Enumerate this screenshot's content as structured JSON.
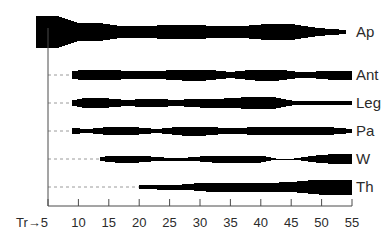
{
  "chart_data": {
    "type": "area",
    "title": "",
    "subtitle": "",
    "xlabel": "",
    "ylabel": "",
    "grid": false,
    "legend_position": "right",
    "axis": {
      "origin_label": "Tr",
      "origin_arrow": "→",
      "xlim": [
        5,
        55
      ],
      "tick_step": 5,
      "tick_labels": [
        "5",
        "10",
        "15",
        "20",
        "25",
        "30",
        "35",
        "40",
        "45",
        "50",
        "55"
      ],
      "tick_values": [
        5,
        10,
        15,
        20,
        25,
        30,
        35,
        40,
        45,
        50,
        55
      ]
    },
    "series": [
      {
        "name": "Ap",
        "label": "Ap",
        "start": 3.0,
        "x": [
          3.0,
          6.5,
          10.0,
          13.5,
          17.0,
          21.0,
          25.0,
          29.0,
          33.0,
          37.0,
          41.0,
          45.0,
          49.5,
          54.0
        ],
        "widths": [
          32,
          32,
          18,
          18,
          12,
          12,
          14,
          14,
          12,
          12,
          16,
          16,
          8,
          4
        ]
      },
      {
        "name": "Ant",
        "label": "Ant",
        "start": 9.0,
        "x": [
          9.0,
          11.0,
          15.0,
          19.0,
          23.0,
          27.0,
          31.0,
          35.0,
          39.0,
          43.0,
          47.0,
          51.0,
          55.0
        ],
        "widths": [
          8,
          10,
          10,
          8,
          8,
          11,
          11,
          6,
          11,
          11,
          5,
          9,
          9
        ]
      },
      {
        "name": "Leg",
        "label": "Leg",
        "start": 9.0,
        "x": [
          9.0,
          11.0,
          14.0,
          18.0,
          22.0,
          26.0,
          30.0,
          34.0,
          38.0,
          42.0,
          45.5,
          49.0,
          55.0
        ],
        "widths": [
          5,
          10,
          10,
          6,
          9,
          6,
          9,
          9,
          12,
          12,
          4,
          4,
          4
        ]
      },
      {
        "name": "Pa",
        "label": "Pa",
        "start": 9.0,
        "x": [
          9.0,
          11.5,
          15.0,
          19.0,
          23.0,
          27.0,
          31.0,
          35.0,
          39.0,
          43.0,
          47.0,
          51.0,
          55.0
        ],
        "widths": [
          6,
          4,
          8,
          8,
          4,
          9,
          9,
          5,
          8,
          8,
          8,
          8,
          4
        ]
      },
      {
        "name": "W",
        "label": "W",
        "start": 13.5,
        "x": [
          13.5,
          16.0,
          20.0,
          24.0,
          28.0,
          32.0,
          36.0,
          40.0,
          42.5,
          45.5,
          49.0,
          52.0,
          55.0
        ],
        "widths": [
          4,
          7,
          7,
          3,
          3,
          7,
          7,
          7,
          1,
          1,
          7,
          10,
          10
        ]
      },
      {
        "name": "Th",
        "label": "Th",
        "start": 20.0,
        "x": [
          20.0,
          23.0,
          27.0,
          31.0,
          35.0,
          39.0,
          43.0,
          46.0,
          49.5,
          55.0
        ],
        "widths": [
          3,
          5,
          5,
          9,
          9,
          9,
          9,
          11,
          15,
          15
        ]
      }
    ]
  },
  "axis_labels": {
    "origin": "Tr→5",
    "ticks": [
      "10",
      "15",
      "20",
      "25",
      "30",
      "35",
      "40",
      "45",
      "50",
      "55"
    ]
  },
  "colors": {
    "band": "#000000",
    "axis": "#4a4a4a",
    "dashed_leader": "#9a9a9a",
    "text": "#2b2b2b",
    "background": "#ffffff"
  }
}
